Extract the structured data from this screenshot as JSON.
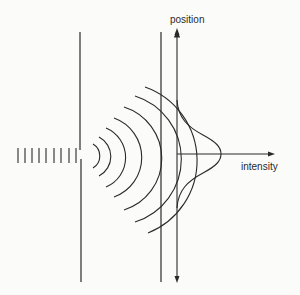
{
  "diagram": {
    "type": "single-slit diffraction schematic",
    "labels": {
      "position_axis": "position",
      "intensity_axis": "intensity"
    },
    "elements": {
      "incident_wavefronts": {
        "count": 8
      },
      "barrier_with_slit": {
        "slit_count": 1
      },
      "diffracted_wavefronts": {
        "count": 6
      },
      "detection_screen": {},
      "intensity_profile": {
        "shape": "gaussian"
      }
    },
    "colors": {
      "ink": "#2a2a2a",
      "background": "#fbfbfa"
    }
  }
}
